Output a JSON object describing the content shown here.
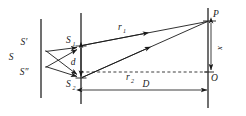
{
  "figure": {
    "type": "optics-ray-diagram",
    "width": 246,
    "height": 116,
    "background_color": "#ffffff",
    "ink_color": "#1a1a1a"
  },
  "labels": {
    "source": "S",
    "source_prime": "S′",
    "source_double_prime": "S″",
    "slit_top_base": "S",
    "slit_top_sub": "1",
    "slit_bottom_base": "S",
    "slit_bottom_sub": "2",
    "slit_separation": "d",
    "ray_top_base": "r",
    "ray_top_sub": "1",
    "ray_bottom_base": "r",
    "ray_bottom_sub": "2",
    "screen_point": "P",
    "screen_origin": "O",
    "screen_offset": "x",
    "screen_distance": "D"
  },
  "geometry": {
    "first_barrier_x": 41,
    "second_barrier_x": 81,
    "screen_x": 208,
    "slit_top_y": 46,
    "slit_bottom_y": 78,
    "axis_y": 72,
    "point_p_y": 21,
    "distance_dim_y": 90
  }
}
